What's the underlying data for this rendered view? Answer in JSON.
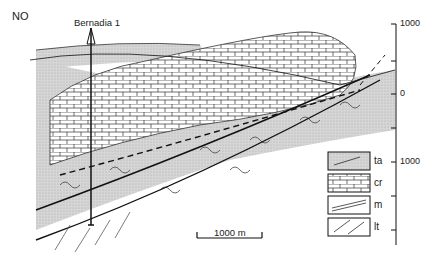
{
  "orientation_label": "NO",
  "well": {
    "name": "Bernadia 1"
  },
  "depth_axis": {
    "ticks": [
      "1000",
      "0",
      "1000"
    ]
  },
  "legend": {
    "items": [
      {
        "code": "ta",
        "pattern": "shaded-wavy"
      },
      {
        "code": "cr",
        "pattern": "brick-limestone"
      },
      {
        "code": "m",
        "pattern": "marl-lines"
      },
      {
        "code": "lt",
        "pattern": "clastic-lines"
      }
    ]
  },
  "scale_bar": {
    "label": "1000 m"
  },
  "colors": {
    "shade": "#cfcfcf",
    "line": "#222222"
  }
}
